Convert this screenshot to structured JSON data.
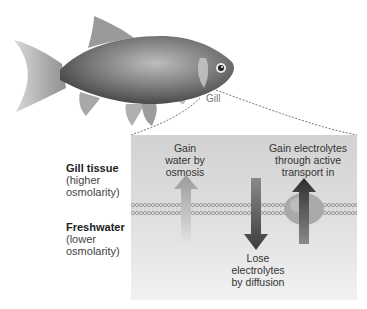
{
  "fish": {
    "label": "Gill",
    "icon": "fish-illustration"
  },
  "side_labels": {
    "gill_tissue": {
      "title": "Gill tissue",
      "line1": "(higher",
      "line2": "osmolarity)"
    },
    "freshwater": {
      "title": "Freshwater",
      "line1": "(lower",
      "line2": "osmolarity)"
    }
  },
  "processes": [
    {
      "id": "water",
      "line1": "Gain",
      "line2": "water by",
      "line3": "osmosis",
      "direction": "up",
      "color": "#b9b9b9"
    },
    {
      "id": "diffusion",
      "line1": "Lose",
      "line2": "electrolytes",
      "line3": "by diffusion",
      "direction": "down",
      "color": "#555555"
    },
    {
      "id": "active",
      "line1": "Gain electrolytes",
      "line2": "through active",
      "line3": "transport in",
      "direction": "up",
      "color": "#3a3a3a"
    }
  ],
  "colors": {
    "panel_top": "#d2d2d2",
    "panel_bottom": "#f2f2f2",
    "membrane": "#9a9a9a",
    "protein": "#a8a8a8"
  }
}
